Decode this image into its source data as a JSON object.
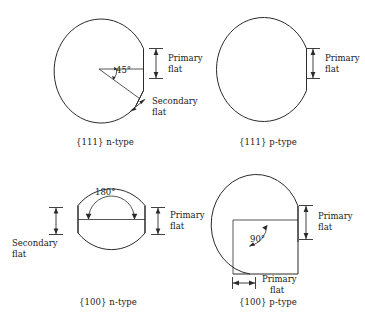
{
  "figure": {
    "line_color": "#2b2b2b",
    "background": "#ffffff"
  },
  "panels": [
    {
      "id": "panel-111-n",
      "caption": "{111} n-type",
      "labels": {
        "primary_flat": "Primary\nflat",
        "primary_flat_line1": "Primary",
        "primary_flat_line2": "flat",
        "secondary_flat_line1": "Secondary",
        "secondary_flat_line2": "flat"
      },
      "angle": "45°",
      "flats": [
        "primary",
        "secondary"
      ]
    },
    {
      "id": "panel-111-p",
      "caption": "{111} p-type",
      "labels": {
        "primary_flat_line1": "Primary",
        "primary_flat_line2": "flat"
      },
      "angle": "",
      "flats": [
        "primary"
      ]
    },
    {
      "id": "panel-100-n",
      "caption": "{100} n-type",
      "labels": {
        "primary_flat_line1": "Primary",
        "primary_flat_line2": "flat",
        "secondary_flat_line1": "Secondary",
        "secondary_flat_line2": "flat"
      },
      "angle": "180°",
      "flats": [
        "primary",
        "secondary"
      ]
    },
    {
      "id": "panel-100-p",
      "caption": "{100} p-type",
      "labels": {
        "primary_flat_line1": "Primary",
        "primary_flat_line2": "flat",
        "secondary_flat_line1": "Primary",
        "secondary_flat_line2": "flat"
      },
      "angle": "90°",
      "flats": [
        "primary",
        "primary-secondary"
      ]
    }
  ]
}
